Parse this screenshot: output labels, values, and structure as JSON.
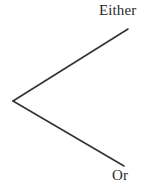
{
  "figure": {
    "name": "either-or-branch-diagram",
    "background_color": "#ffffff",
    "stroke_color": "#333333",
    "text_color": "#2b2b2b",
    "stroke_width": 1.6,
    "width": 153,
    "height": 193
  },
  "labels": {
    "either": "Either",
    "or": "Or"
  },
  "geometry": {
    "vertex": {
      "x": 13,
      "y": 101
    },
    "upper_branch_end": {
      "x": 128,
      "y": 29
    },
    "lower_branch_end": {
      "x": 124,
      "y": 166
    }
  }
}
